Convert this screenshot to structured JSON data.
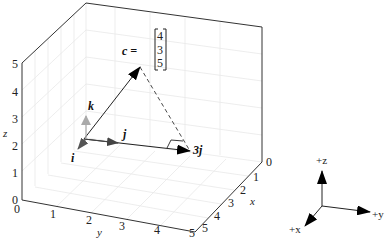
{
  "figure": {
    "type": "3d-vector-diagram",
    "axes": {
      "x": {
        "label": "x",
        "ticks": [
          "0",
          "1",
          "2",
          "3",
          "4",
          "5"
        ]
      },
      "y": {
        "label": "y",
        "ticks": [
          "0",
          "1",
          "2",
          "3",
          "4",
          "5"
        ]
      },
      "z": {
        "label": "z",
        "ticks": [
          "0",
          "1",
          "2",
          "3",
          "4",
          "5"
        ]
      },
      "grid": true
    },
    "vectors": {
      "c": {
        "label": "c =",
        "components": [
          "4",
          "3",
          "5"
        ],
        "style": "solid-black"
      },
      "i": {
        "label": "i",
        "color": "#555555"
      },
      "j": {
        "label": "j",
        "color": "#444444"
      },
      "k": {
        "label": "k",
        "color": "#aaaaaa"
      },
      "three_j": {
        "label": "3j",
        "color": "#000000"
      }
    },
    "projection_line": {
      "style": "dashed",
      "from": "c",
      "to": "3j"
    },
    "right_angle_marker": true,
    "orientation_triad": {
      "z_label": "+z",
      "y_label": "+y",
      "x_label": "+x"
    }
  },
  "caption": {
    "visible": "partially clipped at bottom edge"
  }
}
